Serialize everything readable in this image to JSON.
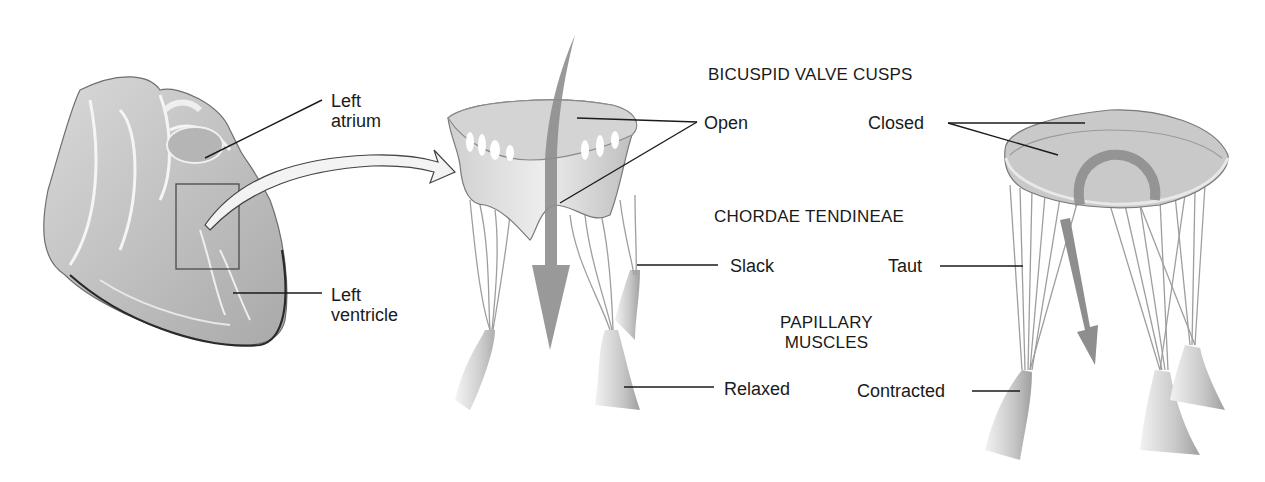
{
  "diagram": {
    "heart_labels": {
      "left_atrium": [
        "Left",
        "atrium"
      ],
      "left_ventricle": [
        "Left",
        "ventricle"
      ]
    },
    "headings": {
      "cusps": "BICUSPID VALVE CUSPS",
      "chordae": "CHORDAE TENDINEAE",
      "papillary": [
        "PAPILLARY",
        "MUSCLES"
      ]
    },
    "open_valve_labels": {
      "cusps": "Open",
      "chordae": "Slack",
      "papillary": "Relaxed"
    },
    "closed_valve_labels": {
      "cusps": "Closed",
      "chordae": "Taut",
      "papillary": "Contracted"
    },
    "colors": {
      "line": "#1a1a1a",
      "tissue_light": "#e6e6e6",
      "tissue_mid": "#bdbdbd",
      "tissue_dark": "#8c8c8c",
      "flow_arrow": "#8a8a8a"
    }
  }
}
